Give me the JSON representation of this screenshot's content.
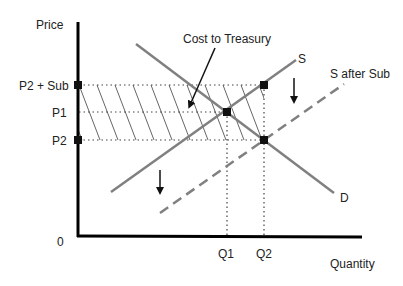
{
  "diagram": {
    "axes": {
      "y_label": "Price",
      "x_label": "Quantity",
      "origin_label": "0"
    },
    "price_labels": {
      "p2_plus_sub": "P2 + Sub",
      "p1": "P1",
      "p2": "P2"
    },
    "quantity_labels": {
      "q1": "Q1",
      "q2": "Q2"
    },
    "curves": {
      "supply": "S",
      "supply_after_subsidy": "S after Sub",
      "demand": "D"
    },
    "annotation": "Cost to Treasury",
    "colors": {
      "axis": "#000000",
      "curve": "#808080",
      "guide": "#555555",
      "hatch": "#666666"
    }
  }
}
